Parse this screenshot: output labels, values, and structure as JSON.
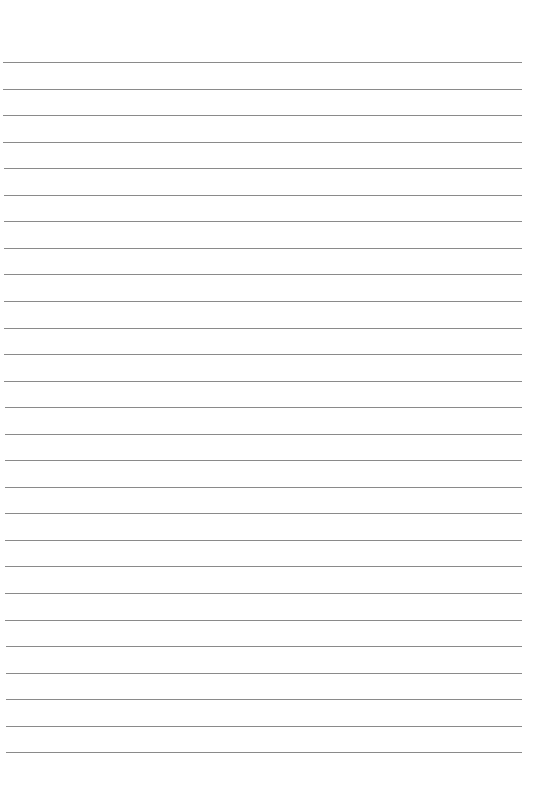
{
  "page": {
    "type": "ruled-paper",
    "background_color": "#ffffff",
    "line_color": "#7d7d7d",
    "line_count": 27,
    "first_line_y": 62,
    "line_spacing": 26.55,
    "line_left_top": 3,
    "line_left_bottom": 6,
    "line_right": 522,
    "text_content": []
  }
}
